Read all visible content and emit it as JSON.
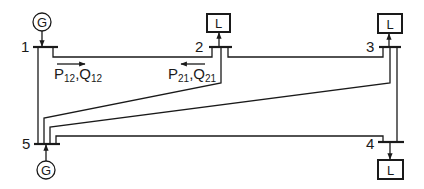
{
  "diagram": {
    "type": "power-system one-line diagram",
    "buses": [
      {
        "id": "1",
        "label": "1",
        "device": "generator",
        "device_symbol": "G"
      },
      {
        "id": "2",
        "label": "2",
        "device": "load",
        "device_symbol": "L"
      },
      {
        "id": "3",
        "label": "3",
        "device": "load",
        "device_symbol": "L"
      },
      {
        "id": "4",
        "label": "4",
        "device": "load",
        "device_symbol": "L"
      },
      {
        "id": "5",
        "label": "5",
        "device": "generator",
        "device_symbol": "G"
      }
    ],
    "lines": [
      {
        "from": "1",
        "to": "2"
      },
      {
        "from": "1",
        "to": "5"
      },
      {
        "from": "2",
        "to": "3"
      },
      {
        "from": "2",
        "to": "5"
      },
      {
        "from": "3",
        "to": "5"
      },
      {
        "from": "3",
        "to": "4"
      },
      {
        "from": "5",
        "to": "4"
      }
    ],
    "flow_labels": {
      "p12": {
        "p": "P",
        "p_sub": "12",
        "sep": ",",
        "q": "Q",
        "q_sub": "12",
        "direction": "right"
      },
      "p21": {
        "p": "P",
        "p_sub": "21",
        "sep": ",",
        "q": "Q",
        "q_sub": "21",
        "direction": "left"
      }
    },
    "colors": {
      "ink": "#1a1a1a",
      "background": "#ffffff"
    }
  }
}
